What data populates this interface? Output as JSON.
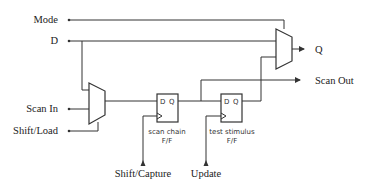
{
  "diagram": {
    "inputs": {
      "mode": "Mode",
      "d": "D",
      "scan_in": "Scan In",
      "shift_load": "Shift/Load",
      "shift_capture": "Shift/Capture",
      "update": "Update"
    },
    "outputs": {
      "q": "Q",
      "scan_out": "Scan Out"
    },
    "flipflops": [
      {
        "d_label": "D",
        "q_label": "Q",
        "caption_line1": "scan chain",
        "caption_line2": "F/F"
      },
      {
        "d_label": "D",
        "q_label": "Q",
        "caption_line1": "test stimulus",
        "caption_line2": "F/F"
      }
    ],
    "muxes": [
      "input-mux",
      "output-mux"
    ],
    "colors": {
      "line": "#333333",
      "background": "#ffffff"
    }
  }
}
